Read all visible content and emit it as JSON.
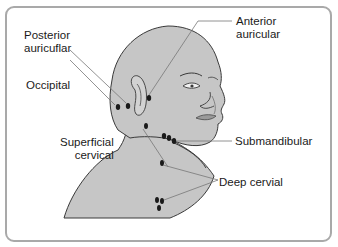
{
  "diagram": {
    "labels": {
      "posterior_auricular": [
        "Posterior",
        "auricuflar"
      ],
      "anterior_auricular": [
        "Anterior",
        "auricular"
      ],
      "occipital": "Occipital",
      "superficial_cervical": [
        "Superficial",
        "cervical"
      ],
      "submandibular": "Submandibular",
      "deep_cervical": "Deep cervial"
    },
    "colors": {
      "skin": "#c6c6c6",
      "outline": "#3a3a3a",
      "node": "#1a1a1a",
      "frame": "#a9a9a9",
      "leader": "#777777"
    }
  }
}
